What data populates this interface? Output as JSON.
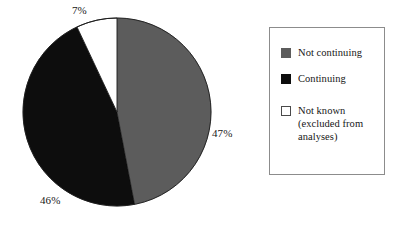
{
  "chart_data": {
    "type": "pie",
    "title": "",
    "subtitle": "",
    "xlabel": "",
    "ylabel": "",
    "grid": false,
    "legend_position": "right",
    "units": "%",
    "start_angle_deg": 0,
    "direction": "clockwise",
    "categories": [
      "Not continuing",
      "Continuing",
      "Not known (excluded from analyses)"
    ],
    "values": [
      47,
      46,
      7
    ],
    "labels": [
      "47%",
      "46%",
      "7%"
    ],
    "colors": [
      "#5c5c5c",
      "#0d0d0d",
      "#ffffff"
    ],
    "slices": [
      {
        "name": "Not continuing",
        "value": 47,
        "label": "47%",
        "color": "#5c5c5c",
        "start_deg": 0,
        "end_deg": 169.2
      },
      {
        "name": "Continuing",
        "value": 46,
        "label": "46%",
        "color": "#0d0d0d",
        "start_deg": 169.2,
        "end_deg": 334.8
      },
      {
        "name": "Not known (excluded from analyses)",
        "value": 7,
        "label": "7%",
        "color": "#ffffff",
        "start_deg": 334.8,
        "end_deg": 360
      }
    ]
  },
  "pie": {
    "label_not_known": "7%",
    "label_not_continuing": "47%",
    "label_continuing": "46%"
  },
  "legend": {
    "items": [
      {
        "label": "Not continuing",
        "sub": "",
        "swatch": "gray-swatch-icon",
        "color": "#5c5c5c"
      },
      {
        "label": "Continuing",
        "sub": "",
        "swatch": "black-swatch-icon",
        "color": "#0d0d0d"
      },
      {
        "label": "Not known",
        "sub": "(excluded from",
        "sub2": "analyses)",
        "swatch": "white-swatch-icon",
        "color": "#ffffff"
      }
    ]
  }
}
